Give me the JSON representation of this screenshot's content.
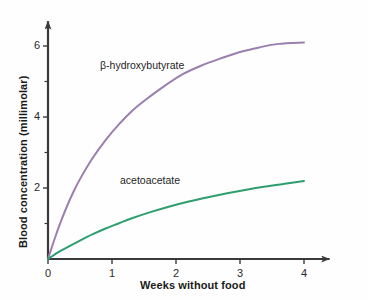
{
  "chart_data": {
    "type": "line",
    "title": "",
    "subtitle": "",
    "xlabel": "Weeks without food",
    "ylabel": "Blood concentration (millimolar)",
    "xlim": [
      0,
      4.4
    ],
    "ylim": [
      0,
      6.7
    ],
    "xticks": [
      0,
      1,
      2,
      3,
      4
    ],
    "xtick_labels": [
      "0",
      "1",
      "2",
      "3",
      "4"
    ],
    "yticks": [
      2,
      4,
      6
    ],
    "ytick_labels": [
      "2",
      "4",
      "6"
    ],
    "yticks_minor": [
      1,
      3,
      5
    ],
    "grid": false,
    "legend_position": "inline-annotation",
    "axis_arrows": true,
    "series": [
      {
        "name": "β-hydroxybutyrate",
        "color": "#9b7fae",
        "x": [
          0,
          0.1,
          0.2,
          0.3,
          0.4,
          0.5,
          0.7,
          0.9,
          1.1,
          1.3,
          1.5,
          1.8,
          2.1,
          2.4,
          2.7,
          3.0,
          3.3,
          3.6,
          4.0
        ],
        "values": [
          0,
          0.55,
          1.05,
          1.5,
          1.9,
          2.25,
          2.85,
          3.35,
          3.78,
          4.15,
          4.45,
          4.85,
          5.2,
          5.45,
          5.65,
          5.83,
          5.96,
          6.06,
          6.1
        ],
        "label_x": 1.1,
        "label_y": 5.3
      },
      {
        "name": "acetoacetate",
        "color": "#2e9e6e",
        "x": [
          0,
          0.15,
          0.3,
          0.5,
          0.7,
          0.9,
          1.1,
          1.3,
          1.6,
          1.9,
          2.2,
          2.5,
          2.8,
          3.1,
          3.4,
          3.7,
          4.0
        ],
        "values": [
          0,
          0.18,
          0.33,
          0.52,
          0.7,
          0.86,
          1.0,
          1.14,
          1.32,
          1.48,
          1.62,
          1.74,
          1.85,
          1.95,
          2.04,
          2.12,
          2.2
        ],
        "label_x": 1.3,
        "label_y": 2.25
      }
    ],
    "annotations": [
      {
        "text": "β-hydroxybutyrate",
        "series": "β-hydroxybutyrate"
      },
      {
        "text": "acetoacetate",
        "series": "acetoacetate"
      }
    ],
    "colors": {
      "bhb": "#9b7fae",
      "acetoacetate": "#2e9e6e",
      "axis": "#3a3a3a",
      "text": "#1a1a1a",
      "background": "#fefefe"
    }
  }
}
